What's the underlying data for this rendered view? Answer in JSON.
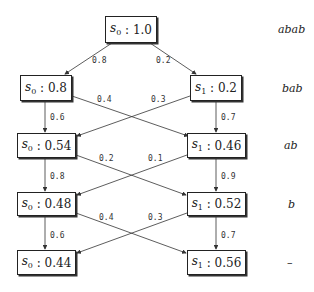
{
  "nodes": [
    {
      "id": "r0",
      "state": "s",
      "sub": "0",
      "value": "1.0"
    },
    {
      "id": "r1a",
      "state": "s",
      "sub": "0",
      "value": "0.8"
    },
    {
      "id": "r1b",
      "state": "s",
      "sub": "1",
      "value": "0.2"
    },
    {
      "id": "r2a",
      "state": "s",
      "sub": "0",
      "value": "0.54"
    },
    {
      "id": "r2b",
      "state": "s",
      "sub": "1",
      "value": "0.46"
    },
    {
      "id": "r3a",
      "state": "s",
      "sub": "0",
      "value": "0.48"
    },
    {
      "id": "r3b",
      "state": "s",
      "sub": "1",
      "value": "0.52"
    },
    {
      "id": "r4a",
      "state": "s",
      "sub": "0",
      "value": "0.44"
    },
    {
      "id": "r4b",
      "state": "s",
      "sub": "1",
      "value": "0.56"
    }
  ],
  "edges": [
    {
      "from": "r0",
      "to": "r1a",
      "label": "0.8"
    },
    {
      "from": "r0",
      "to": "r1b",
      "label": "0.2"
    },
    {
      "from": "r1a",
      "to": "r2a",
      "label": "0.6"
    },
    {
      "from": "r1a",
      "to": "r2b",
      "label": "0.4"
    },
    {
      "from": "r1b",
      "to": "r2a",
      "label": "0.3"
    },
    {
      "from": "r1b",
      "to": "r2b",
      "label": "0.7"
    },
    {
      "from": "r2a",
      "to": "r3a",
      "label": "0.8"
    },
    {
      "from": "r2a",
      "to": "r3b",
      "label": "0.2"
    },
    {
      "from": "r2b",
      "to": "r3a",
      "label": "0.1"
    },
    {
      "from": "r2b",
      "to": "r3b",
      "label": "0.9"
    },
    {
      "from": "r3a",
      "to": "r4a",
      "label": "0.6"
    },
    {
      "from": "r3a",
      "to": "r4b",
      "label": "0.4"
    },
    {
      "from": "r3b",
      "to": "r4a",
      "label": "0.3"
    },
    {
      "from": "r3b",
      "to": "r4b",
      "label": "0.7"
    }
  ],
  "row_labels": [
    "abab",
    "bab",
    "ab",
    "b",
    "–"
  ]
}
